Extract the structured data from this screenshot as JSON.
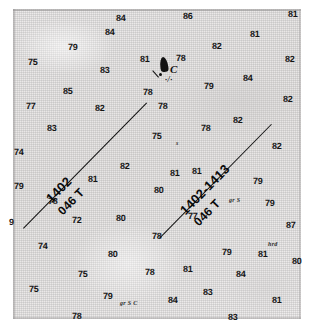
{
  "document": {
    "type": "scanned-survey-chart-fragment",
    "description": "Scanned bathymetric survey sheet with sounding depths and two labelled survey track lines"
  },
  "chart_data": {
    "type": "scatter",
    "title": "",
    "xlabel": "",
    "ylabel": "",
    "grid": false,
    "legend_position": "none",
    "soundings": [
      {
        "value": "84",
        "x": 116,
        "y": 14
      },
      {
        "value": "86",
        "x": 183,
        "y": 12
      },
      {
        "value": "81",
        "x": 288,
        "y": 10
      },
      {
        "value": "84",
        "x": 105,
        "y": 28
      },
      {
        "value": "81",
        "x": 250,
        "y": 30
      },
      {
        "value": "79",
        "x": 68,
        "y": 43
      },
      {
        "value": "82",
        "x": 212,
        "y": 42
      },
      {
        "value": "75",
        "x": 28,
        "y": 58
      },
      {
        "value": "83",
        "x": 100,
        "y": 66
      },
      {
        "value": "81",
        "x": 140,
        "y": 55
      },
      {
        "value": "78",
        "x": 176,
        "y": 54
      },
      {
        "value": "82",
        "x": 285,
        "y": 55
      },
      {
        "value": "85",
        "x": 63,
        "y": 87
      },
      {
        "value": "78",
        "x": 143,
        "y": 88
      },
      {
        "value": "79",
        "x": 204,
        "y": 82
      },
      {
        "value": "84",
        "x": 243,
        "y": 74
      },
      {
        "value": "77",
        "x": 26,
        "y": 102
      },
      {
        "value": "82",
        "x": 95,
        "y": 104
      },
      {
        "value": "78",
        "x": 158,
        "y": 102
      },
      {
        "value": "82",
        "x": 283,
        "y": 95
      },
      {
        "value": "83",
        "x": 47,
        "y": 124
      },
      {
        "value": "75",
        "x": 152,
        "y": 132
      },
      {
        "value": "78",
        "x": 201,
        "y": 124
      },
      {
        "value": "82",
        "x": 233,
        "y": 116
      },
      {
        "value": "74",
        "x": 14,
        "y": 148
      },
      {
        "value": "82",
        "x": 120,
        "y": 162
      },
      {
        "value": "81",
        "x": 192,
        "y": 167
      },
      {
        "value": "82",
        "x": 272,
        "y": 142
      },
      {
        "value": "81",
        "x": 88,
        "y": 175
      },
      {
        "value": "79",
        "x": 14,
        "y": 182
      },
      {
        "value": "80",
        "x": 154,
        "y": 186
      },
      {
        "value": "81",
        "x": 170,
        "y": 169
      },
      {
        "value": "79",
        "x": 253,
        "y": 177
      },
      {
        "value": "9",
        "x": 9,
        "y": 218
      },
      {
        "value": "78",
        "x": 48,
        "y": 197
      },
      {
        "value": "72",
        "x": 72,
        "y": 216
      },
      {
        "value": "80",
        "x": 116,
        "y": 214
      },
      {
        "value": "77",
        "x": 188,
        "y": 212
      },
      {
        "value": "79",
        "x": 265,
        "y": 199
      },
      {
        "value": "78",
        "x": 152,
        "y": 232
      },
      {
        "value": "87",
        "x": 286,
        "y": 221
      },
      {
        "value": "74",
        "x": 38,
        "y": 242
      },
      {
        "value": "80",
        "x": 108,
        "y": 250
      },
      {
        "value": "79",
        "x": 222,
        "y": 248
      },
      {
        "value": "81",
        "x": 258,
        "y": 250
      },
      {
        "value": "80",
        "x": 292,
        "y": 257
      },
      {
        "value": "75",
        "x": 78,
        "y": 270
      },
      {
        "value": "78",
        "x": 145,
        "y": 268
      },
      {
        "value": "81",
        "x": 183,
        "y": 265
      },
      {
        "value": "84",
        "x": 236,
        "y": 270
      },
      {
        "value": "75",
        "x": 29,
        "y": 285
      },
      {
        "value": "79",
        "x": 103,
        "y": 292
      },
      {
        "value": "84",
        "x": 168,
        "y": 296
      },
      {
        "value": "83",
        "x": 203,
        "y": 288
      },
      {
        "value": "81",
        "x": 272,
        "y": 296
      },
      {
        "value": "78",
        "x": 72,
        "y": 312
      },
      {
        "value": "83",
        "x": 228,
        "y": 313
      }
    ],
    "seabed_notes": [
      {
        "text": "s",
        "x": 176,
        "y": 140
      },
      {
        "text": "gr S",
        "x": 229,
        "y": 197
      },
      {
        "text": "hrd",
        "x": 268,
        "y": 241
      },
      {
        "text": "gr S C",
        "x": 120,
        "y": 300
      }
    ]
  },
  "tracks": [
    {
      "id": "track-left",
      "line_number": "1402",
      "heading": "046 T",
      "label_top": "1402",
      "label_bottom": "046 T"
    },
    {
      "id": "track-right",
      "line_number": "1402-1413",
      "heading": "046 T",
      "label_top": "1402-1413",
      "label_bottom": "046 T"
    }
  ],
  "station": {
    "label": "C",
    "sub_note": "·/·"
  }
}
